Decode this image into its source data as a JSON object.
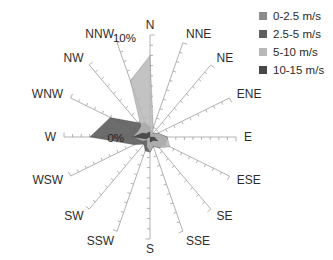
{
  "chart_data": {
    "type": "radar-windrose",
    "categories": [
      "N",
      "NNE",
      "NE",
      "ENE",
      "E",
      "ESE",
      "SE",
      "SSE",
      "S",
      "SSW",
      "SW",
      "WSW",
      "W",
      "WNW",
      "NW",
      "NNW"
    ],
    "axis": {
      "min": 0,
      "max": 10,
      "min_label": "0%",
      "max_label": "10%",
      "minor_tick_step_percent": 1
    },
    "legend_position": "top-right",
    "spoke_color": "#9e9e9e",
    "text_color": "#2d2d2d",
    "series": [
      {
        "name": "0-2.5 m/s",
        "color": "#8c8c8c",
        "fill_opacity": 0.9,
        "values": [
          0.5,
          0.5,
          0.5,
          0.5,
          1,
          1,
          0.5,
          0.5,
          1,
          0.5,
          0.5,
          1,
          1,
          0.5,
          0.5,
          0.5
        ]
      },
      {
        "name": "2.5-5 m/s",
        "color": "#5f5f5f",
        "fill_opacity": 0.92,
        "values": [
          1,
          0.5,
          0.5,
          1,
          2,
          2,
          1.5,
          1,
          1.5,
          1.5,
          1,
          2,
          7,
          5,
          2,
          1.5
        ]
      },
      {
        "name": "5-10 m/s",
        "color": "#b8b8b8",
        "fill_opacity": 0.85,
        "values": [
          8,
          1,
          0.5,
          1,
          2,
          2.5,
          1.5,
          1,
          1.5,
          1,
          0.5,
          1,
          2,
          1.5,
          1.5,
          6
        ]
      },
      {
        "name": "10-15 m/s",
        "color": "#474747",
        "fill_opacity": 0.95,
        "values": [
          0.5,
          0,
          0,
          0,
          0.5,
          1,
          0.5,
          0.5,
          0.5,
          0,
          0,
          0.5,
          2,
          1,
          0.5,
          0.5
        ]
      }
    ]
  }
}
